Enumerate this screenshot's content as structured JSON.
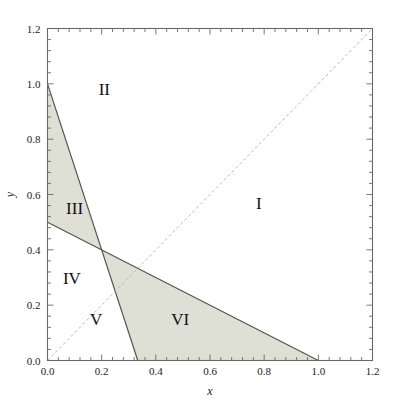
{
  "chart_data": {
    "type": "line",
    "title": "",
    "subtitle": "",
    "xlabel": "x",
    "ylabel": "y",
    "xlim": [
      0.0,
      1.2
    ],
    "ylim": [
      0.0,
      1.2
    ],
    "grid": false,
    "legend": "none",
    "xticks": [
      "0.0",
      "0.2",
      "0.4",
      "0.6",
      "0.8",
      "1.0",
      "1.2"
    ],
    "xtick_values": [
      0.0,
      0.2,
      0.4,
      0.6,
      0.8,
      1.0,
      1.2
    ],
    "yticks": [
      "0.0",
      "0.2",
      "0.4",
      "0.6",
      "0.8",
      "1.0",
      "1.2"
    ],
    "ytick_values": [
      0.0,
      0.2,
      0.4,
      0.6,
      0.8,
      1.0,
      1.2
    ],
    "minor_ticks_per_interval": 4,
    "series": [
      {
        "name": "steep-boundary",
        "style": "solid",
        "color": "#555550",
        "x": [
          0.0,
          0.3333
        ],
        "y": [
          1.0,
          0.0
        ],
        "equation": "y = 1 - 3x"
      },
      {
        "name": "shallow-boundary",
        "style": "solid",
        "color": "#555550",
        "x": [
          0.0,
          1.0
        ],
        "y": [
          0.5,
          0.0
        ],
        "equation": "y = (1 - x)/2"
      },
      {
        "name": "diagonal",
        "style": "dashed",
        "color": "#b9b9ae",
        "x": [
          0.0,
          1.2
        ],
        "y": [
          0.0,
          1.2
        ],
        "equation": "y = x"
      }
    ],
    "intersection_point": [
      0.2,
      0.4
    ],
    "shaded_regions": [
      {
        "name": "region-III-wedge",
        "fill": "#dedfd5",
        "polygon": [
          [
            0.0,
            1.0
          ],
          [
            0.2,
            0.4
          ],
          [
            0.0,
            0.5
          ]
        ]
      },
      {
        "name": "region-VI-triangle",
        "fill": "#dedfd5",
        "polygon": [
          [
            0.2,
            0.4
          ],
          [
            1.0,
            0.0
          ],
          [
            0.3333,
            0.0
          ]
        ]
      }
    ],
    "annotations": [
      {
        "label": "I",
        "x": 0.78,
        "y": 0.57
      },
      {
        "label": "II",
        "x": 0.21,
        "y": 0.98
      },
      {
        "label": "III",
        "x": 0.1,
        "y": 0.55
      },
      {
        "label": "IV",
        "x": 0.09,
        "y": 0.3
      },
      {
        "label": "V",
        "x": 0.18,
        "y": 0.15
      },
      {
        "label": "VI",
        "x": 0.49,
        "y": 0.15
      }
    ]
  },
  "axes": {
    "x_title": "x",
    "y_title": "y"
  },
  "colors": {
    "axis": "#6a6a62",
    "shade": "#dedfd5",
    "solid_line": "#555550",
    "dashed_line": "#b9b9ae",
    "text": "#1b1b1b",
    "background": "#ffffff"
  }
}
